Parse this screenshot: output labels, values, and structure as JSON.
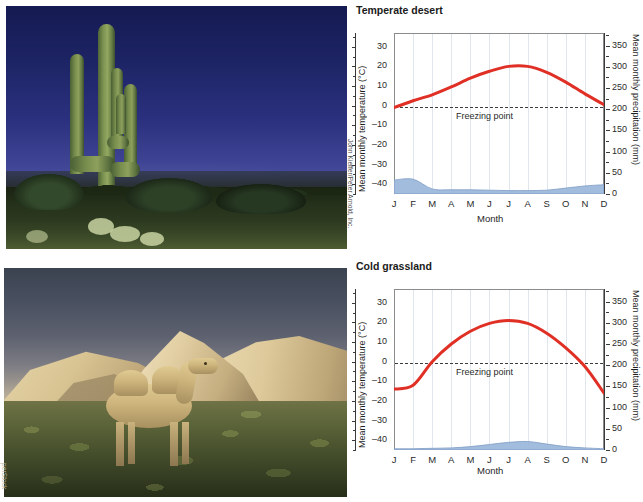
{
  "figure": {
    "photos": [
      {
        "name": "temperate-desert-photo",
        "alt": "Saguaro cactus in temperate desert at dusk",
        "credit": "John Kieffer/Peter Arnold, Inc."
      },
      {
        "name": "cold-grassland-photo",
        "alt": "Bactrian camel on cold grassland with sand dunes",
        "credit": "perStock"
      }
    ]
  },
  "charts": [
    {
      "title": "Temperate desert",
      "freezing_label": "Freezing point",
      "xlabel": "Month",
      "ylabel_left": "Mean monthly temperature (°C)",
      "ylabel_right": "Mean monthly precipitation (mm)",
      "months": [
        "J",
        "F",
        "M",
        "A",
        "M",
        "J",
        "J",
        "A",
        "S",
        "O",
        "N",
        "D"
      ],
      "ticks_left": [
        "30",
        "20",
        "10",
        "0",
        "–10",
        "–20",
        "–30",
        "–40"
      ],
      "ticks_right": [
        "350",
        "300",
        "250",
        "200",
        "150",
        "100",
        "50",
        "0"
      ]
    },
    {
      "title": "Cold grassland",
      "freezing_label": "Freezing point",
      "xlabel": "Month",
      "ylabel_left": "Mean monthly temperature (°C)",
      "ylabel_right": "Mean monthly precipitation (mm)",
      "months": [
        "J",
        "F",
        "M",
        "A",
        "M",
        "J",
        "J",
        "A",
        "S",
        "O",
        "N",
        "D"
      ],
      "ticks_left": [
        "30",
        "20",
        "10",
        "0",
        "–10",
        "–20",
        "–30",
        "–40"
      ],
      "ticks_right": [
        "350",
        "300",
        "250",
        "200",
        "150",
        "100",
        "50",
        "0"
      ]
    }
  ],
  "chart_data": [
    {
      "type": "line",
      "title": "Temperate desert",
      "xlabel": "Month",
      "ylabel": "Mean monthly temperature (°C)",
      "ylabel_secondary": "Mean monthly precipitation (mm)",
      "categories": [
        "J",
        "F",
        "M",
        "A",
        "M",
        "J",
        "J",
        "A",
        "S",
        "O",
        "N",
        "D"
      ],
      "ylim": [
        -45,
        37
      ],
      "ylim_secondary": [
        0,
        380
      ],
      "grid": true,
      "legend": "none",
      "annotations": [
        {
          "text": "Freezing point",
          "y": 0
        }
      ],
      "series": [
        {
          "name": "Mean monthly temperature (°C)",
          "type": "line",
          "color": "#e03025",
          "values": [
            -1,
            2.5,
            5.5,
            9.5,
            14,
            17.5,
            20,
            20,
            17,
            12,
            6,
            0.5
          ]
        },
        {
          "name": "Mean monthly precipitation (mm)",
          "type": "area",
          "axis": "secondary",
          "color": "#9db8dc",
          "values": [
            33,
            35,
            12,
            10,
            10,
            9,
            8,
            8,
            9,
            14,
            19,
            22
          ]
        }
      ]
    },
    {
      "type": "line",
      "title": "Cold grassland",
      "xlabel": "Month",
      "ylabel": "Mean monthly temperature (°C)",
      "ylabel_secondary": "Mean monthly precipitation (mm)",
      "categories": [
        "J",
        "F",
        "M",
        "A",
        "M",
        "J",
        "J",
        "A",
        "S",
        "O",
        "N",
        "D"
      ],
      "ylim": [
        -45,
        37
      ],
      "ylim_secondary": [
        0,
        380
      ],
      "grid": true,
      "legend": "none",
      "annotations": [
        {
          "text": "Freezing point",
          "y": 0
        }
      ],
      "series": [
        {
          "name": "Mean monthly temperature (°C)",
          "type": "line",
          "color": "#e03025",
          "values": [
            -14,
            -12,
            0,
            9,
            15.5,
            19.5,
            21,
            19.5,
            14.5,
            7,
            -2.5,
            -16
          ]
        },
        {
          "name": "Mean monthly precipitation (mm)",
          "type": "area",
          "axis": "secondary",
          "color": "#9db8dc",
          "values": [
            3,
            3,
            4,
            5,
            8,
            13,
            18,
            20,
            14,
            8,
            5,
            3
          ]
        }
      ]
    }
  ]
}
